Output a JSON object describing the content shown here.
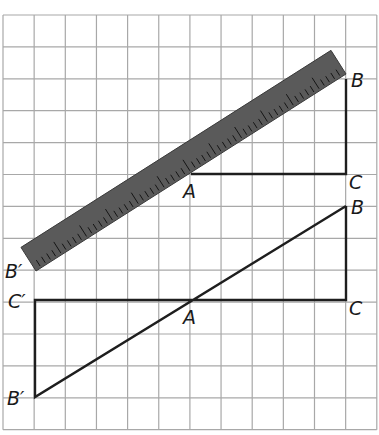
{
  "figure": {
    "grid": {
      "x0": 3,
      "y0": 15,
      "cols": 12,
      "rows": 13,
      "cell_w": 31.15,
      "cell_h": 31.9,
      "color": "#a8a8a8"
    },
    "ruler": {
      "color": "#5a5a5a",
      "start": [
        36,
        271
      ],
      "end": [
        346,
        74
      ],
      "width": 28,
      "tick_count": 60,
      "long_tick_every": 5
    },
    "upper_triangle": {
      "vertices": {
        "A": [
          191,
          174
        ],
        "B": [
          346,
          79
        ],
        "C": [
          346,
          174
        ]
      },
      "segments": [
        [
          "A",
          "C"
        ],
        [
          "C",
          "B"
        ]
      ]
    },
    "lower_figure": {
      "vertices": {
        "B": [
          346,
          206
        ],
        "C": [
          346,
          300
        ],
        "A": [
          191,
          300
        ],
        "C_prime": [
          35,
          300
        ],
        "B_prime": [
          35,
          397
        ]
      },
      "segments": [
        [
          "B",
          "C"
        ],
        [
          "C",
          "C_prime"
        ],
        [
          "C_prime",
          "B_prime"
        ],
        [
          "B_prime",
          "B"
        ]
      ]
    },
    "labels": {
      "upper_B": "B",
      "upper_C": "C",
      "upper_A": "A",
      "ruler_B_prime": "B′",
      "lower_B": "B",
      "lower_C": "C",
      "lower_A": "A",
      "lower_C_prime": "C′",
      "lower_B_prime": "B′"
    }
  }
}
